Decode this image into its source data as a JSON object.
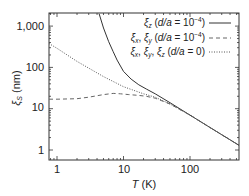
{
  "chart_data": {
    "type": "line",
    "title": "",
    "xlabel": "T (K)",
    "ylabel": "ξ_S (nm)",
    "xscale": "log",
    "yscale": "log",
    "xlim": [
      0.75,
      550
    ],
    "ylim": [
      0.6,
      2000
    ],
    "x_ticks": [
      "1",
      "10",
      "100"
    ],
    "y_ticks": [
      "1",
      "10",
      "100",
      "1,000"
    ],
    "grid": false,
    "legend_position": "upper right",
    "series": [
      {
        "name": "ξz (d/a = 10⁻⁴)",
        "style": "solid",
        "x": [
          4.3,
          5,
          6,
          7,
          8,
          10,
          13,
          17,
          22,
          30,
          50,
          100,
          200,
          550
        ],
        "y": [
          2000,
          900,
          420,
          240,
          150,
          80,
          52,
          38,
          30,
          23,
          14,
          7,
          3.5,
          1.3
        ]
      },
      {
        "name": "ξx, ξy (d/a = 10⁻⁴)",
        "style": "dashed",
        "x": [
          0.75,
          1,
          2,
          3,
          5,
          7,
          9,
          12,
          17,
          22,
          30,
          50,
          100,
          200,
          550
        ],
        "y": [
          17,
          17,
          17.5,
          19,
          22,
          23.5,
          23,
          22,
          21,
          20,
          18,
          13,
          7,
          3.5,
          1.3
        ]
      },
      {
        "name": "ξx, ξy, ξz (d/a = 0)",
        "style": "dotted",
        "x": [
          0.75,
          1,
          2,
          5,
          10,
          20,
          30,
          50,
          100,
          200,
          550
        ],
        "y": [
          380,
          290,
          140,
          60,
          34,
          23,
          19,
          13,
          7,
          3.5,
          1.3
        ]
      }
    ]
  },
  "axes": {
    "x_label_italic": "T",
    "x_label_unit": " (K)",
    "y_label_symbol": "ξ",
    "y_label_sub": "S",
    "y_label_unit": " (nm)",
    "x_tick_labels": [
      "1",
      "10",
      "100"
    ],
    "y_tick_labels": [
      "1",
      "10",
      "100",
      "1,000"
    ]
  },
  "legend": {
    "entries": [
      {
        "sym": "ξ",
        "sub": "z",
        "cond_pre": "(",
        "cond_var": "d/a",
        "cond_eq": " = 10",
        "cond_exp": "−4",
        "cond_post": ")"
      },
      {
        "sym": "ξ",
        "sub": "x",
        "sym2": "ξ",
        "sub2": "y",
        "cond_pre": "(",
        "cond_var": "d/a",
        "cond_eq": " = 10",
        "cond_exp": "−4",
        "cond_post": ")"
      },
      {
        "sym": "ξ",
        "sub": "x",
        "sym2": "ξ",
        "sub2": "y",
        "sym3": "ξ",
        "sub3": "z",
        "cond_pre": "(",
        "cond_var": "d/a",
        "cond_eq": " = 0",
        "cond_post": ")"
      }
    ]
  }
}
